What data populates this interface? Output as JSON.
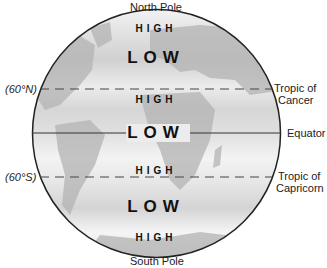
{
  "poles": {
    "north": "North Pole",
    "south": "South Pole"
  },
  "bands": [
    {
      "label": "HIGH",
      "type": "high"
    },
    {
      "label": "LOW",
      "type": "low"
    },
    {
      "label": "HIGH",
      "type": "high"
    },
    {
      "label": "LOW",
      "type": "low"
    },
    {
      "label": "HIGH",
      "type": "high"
    },
    {
      "label": "LOW",
      "type": "low"
    },
    {
      "label": "HIGH",
      "type": "high"
    }
  ],
  "latitude_labels": {
    "north": "(60°N)",
    "south": "(60°S)"
  },
  "right_labels": {
    "tropic_cancer_1": "Tropic of",
    "tropic_cancer_2": "Cancer",
    "equator": "Equator",
    "tropic_capricorn_1": "Tropic of",
    "tropic_capricorn_2": "Capricorn"
  },
  "colors": {
    "land": "#b5b5b5",
    "ocean_dark": "#cfcfcf",
    "ocean_light": "#f4f4f4",
    "outline": "#222222"
  }
}
